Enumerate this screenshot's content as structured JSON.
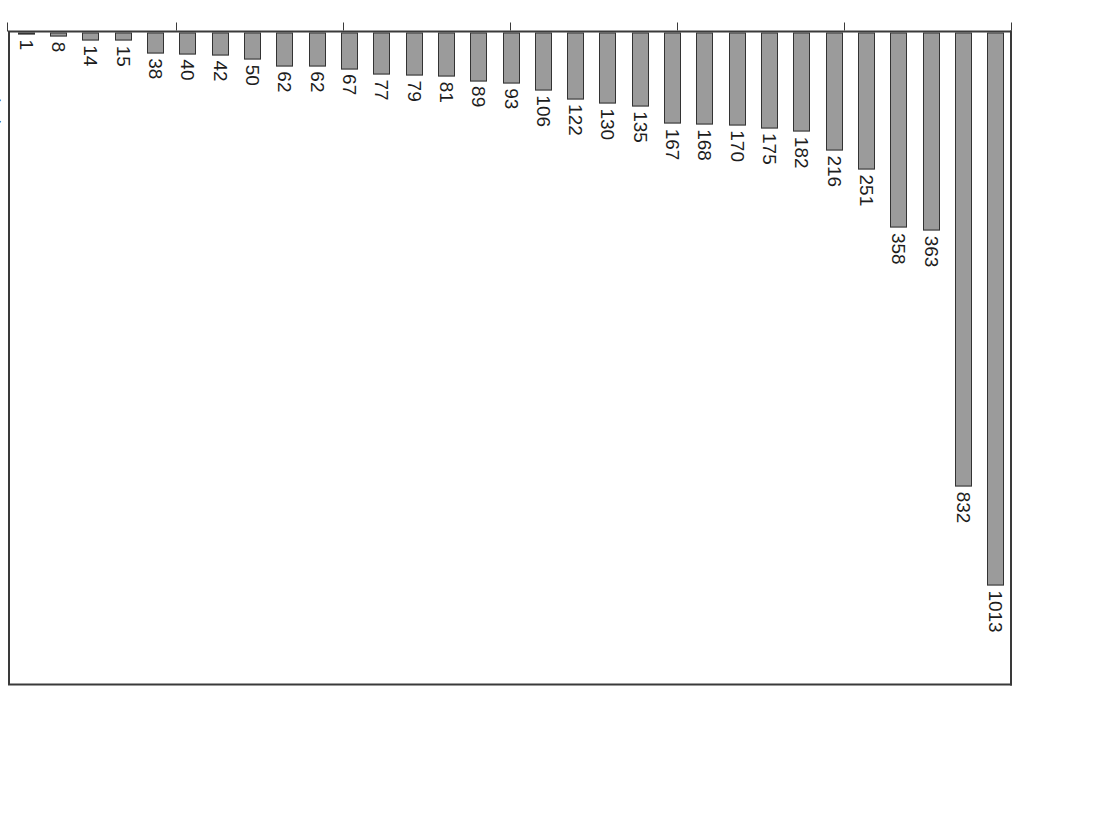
{
  "chart_data": {
    "type": "bar",
    "orientation": "vertical-rotated-90",
    "title": "",
    "subtitle": "",
    "xlabel": "",
    "ylabel": "",
    "ylim": [
      0,
      1200
    ],
    "yticks": [
      0,
      200,
      400,
      600,
      800,
      1000,
      1200
    ],
    "ytick_labels": [
      "0",
      "200",
      "400",
      "600",
      "800",
      "1000",
      "1200"
    ],
    "grid": false,
    "legend": null,
    "bar_color": "#9b9b9b",
    "bar_edge_color": "#333333",
    "axis_color": "#3a3a3a",
    "categories": [
      "广东",
      "江苏",
      "浙江",
      "山东",
      "河北",
      "湖北",
      "黑龙江",
      "上海",
      "安徽",
      "四川",
      "河南",
      "福建",
      "北京",
      "陕西",
      "广西",
      "吉林",
      "湖南",
      "天津",
      "甘肃",
      "重庆",
      "辽宁",
      "江西",
      "山西",
      "内蒙古",
      "贵州",
      "云南",
      "新疆",
      "宁夏",
      "青海",
      "海南",
      "西藏"
    ],
    "ranks": [
      "1",
      "2",
      "3",
      "4",
      "5",
      "6",
      "7",
      "8",
      "9",
      "10",
      "11",
      "12",
      "13",
      "14",
      "15",
      "16",
      "17",
      "18",
      "19",
      "20",
      "21",
      "22",
      "22",
      "24",
      "25",
      "26",
      "27",
      "28",
      "29",
      "30",
      "31"
    ],
    "values": [
      1013,
      832,
      363,
      358,
      251,
      216,
      182,
      175,
      170,
      168,
      167,
      135,
      130,
      122,
      106,
      93,
      89,
      81,
      79,
      77,
      67,
      62,
      62,
      50,
      42,
      40,
      38,
      15,
      14,
      8,
      1
    ],
    "value_labels": [
      "1013",
      "832",
      "363",
      "358",
      "251",
      "216",
      "182",
      "175",
      "170",
      "168",
      "167",
      "135",
      "130",
      "122",
      "106",
      "93",
      "89",
      "81",
      "79",
      "77",
      "67",
      "62",
      "62",
      "50",
      "42",
      "40",
      "38",
      "15",
      "14",
      "8",
      "1"
    ]
  }
}
